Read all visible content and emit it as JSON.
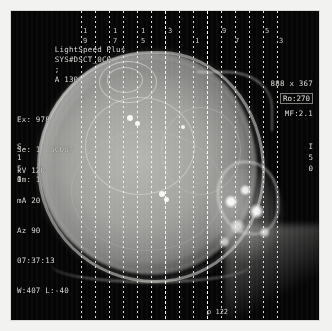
{
  "viewer": {
    "scanner_model": "LightSpeed Plus",
    "protocol_id": "SYS#DSCT_0C0",
    "separator": ";",
    "series_code": "A 130",
    "exam": "Ex: 978",
    "series": "Se: 1  SCOUT",
    "image": "Im: 1",
    "matrix": "888 x 367",
    "magnification": "MF:2.1",
    "rotation": "Ro:270",
    "params": {
      "kv": "kV 120",
      "ma": "mA 20",
      "angle": "Az 90",
      "time": "07:37:13",
      "window_level": "W:407 L:-40"
    },
    "side_left": [
      "S",
      "1",
      "5",
      "0"
    ],
    "side_right": [
      "I",
      "5",
      "0"
    ],
    "bottom_marker": "p 122",
    "slice_numbers": [
      {
        "label": "1",
        "x": 70
      },
      {
        "label": "9",
        "x": 70
      },
      {
        "label": "1",
        "x": 100
      },
      {
        "label": "7",
        "x": 100
      },
      {
        "label": "1",
        "x": 128
      },
      {
        "label": "5",
        "x": 128
      },
      {
        "label": "3",
        "x": 155
      },
      {
        "label": "1",
        "x": 182
      },
      {
        "label": "9",
        "x": 209
      },
      {
        "label": "7",
        "x": 222
      },
      {
        "label": "5",
        "x": 252
      },
      {
        "label": "3",
        "x": 266
      }
    ],
    "slice_lines_x": [
      70,
      84,
      98,
      112,
      126,
      140,
      154,
      168,
      182,
      196,
      210,
      224,
      238,
      252,
      266
    ],
    "bright_lines_x": [
      154,
      196
    ],
    "colors": {
      "background": "#050505",
      "overlay_text": "#dcdcd8",
      "page_bg": "#f2f2f0"
    }
  }
}
